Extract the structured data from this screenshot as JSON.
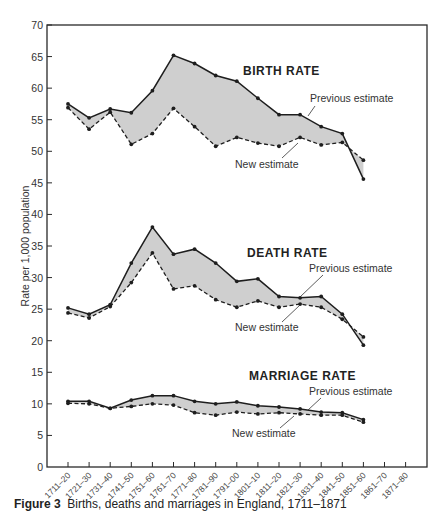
{
  "chart_data": {
    "type": "line",
    "title": "",
    "xlabel": "",
    "ylabel": "Rate per 1,000 population",
    "ylim": [
      0,
      70
    ],
    "yticks": [
      0,
      5,
      10,
      15,
      20,
      25,
      30,
      35,
      40,
      45,
      50,
      55,
      60,
      65,
      70
    ],
    "grid": false,
    "categories": [
      "1711–20",
      "1721–30",
      "1731–40",
      "1741–50",
      "1751–60",
      "1761–70",
      "1771–80",
      "1781–90",
      "1791–00",
      "1801–10",
      "1811–20",
      "1821–30",
      "1831–40",
      "1841–50",
      "1851–60",
      "1861–70",
      "1871–80"
    ],
    "groups": [
      {
        "name": "BIRTH RATE",
        "series": [
          {
            "name": "Previous estimate",
            "style": "solid",
            "values": [
              57.5,
              55.3,
              56.7,
              56.1,
              59.6,
              65.2,
              63.9,
              62.0,
              61.1,
              58.4,
              55.8,
              55.8,
              53.9,
              52.8,
              45.6,
              null,
              null
            ]
          },
          {
            "name": "New estimate",
            "style": "dashed",
            "values": [
              56.9,
              53.5,
              56.2,
              51.1,
              52.8,
              56.8,
              53.9,
              50.8,
              52.2,
              51.3,
              50.8,
              52.2,
              51.0,
              51.4,
              48.6,
              null,
              null
            ]
          }
        ]
      },
      {
        "name": "DEATH RATE",
        "series": [
          {
            "name": "Previous estimate",
            "style": "solid",
            "values": [
              25.2,
              24.2,
              25.7,
              32.3,
              38.0,
              33.7,
              34.5,
              32.3,
              29.4,
              29.8,
              27.0,
              26.8,
              27.0,
              24.2,
              19.3,
              null,
              null
            ]
          },
          {
            "name": "New estimate",
            "style": "dashed",
            "values": [
              24.4,
              23.6,
              25.4,
              29.2,
              33.9,
              28.2,
              28.7,
              26.5,
              25.3,
              26.3,
              25.3,
              25.8,
              25.3,
              23.4,
              20.6,
              null,
              null
            ]
          }
        ]
      },
      {
        "name": "MARRIAGE RATE",
        "series": [
          {
            "name": "Previous estimate",
            "style": "solid",
            "values": [
              10.4,
              10.4,
              9.3,
              10.6,
              11.3,
              11.3,
              10.4,
              10.0,
              10.3,
              9.7,
              9.5,
              9.2,
              8.7,
              8.6,
              7.5,
              null,
              null
            ]
          },
          {
            "name": "New estimate",
            "style": "dashed",
            "values": [
              10.1,
              10.0,
              9.3,
              9.6,
              10.0,
              9.8,
              8.6,
              8.2,
              8.7,
              8.4,
              8.6,
              8.4,
              8.2,
              8.2,
              7.1,
              null,
              null
            ]
          }
        ]
      }
    ],
    "annotations": [
      {
        "text": "BIRTH RATE",
        "group": 0
      },
      {
        "text": "Previous estimate",
        "group": 0
      },
      {
        "text": "New estimate",
        "group": 0
      },
      {
        "text": "DEATH RATE",
        "group": 1
      },
      {
        "text": "Previous estimate",
        "group": 1
      },
      {
        "text": "New estimate",
        "group": 1
      },
      {
        "text": "MARRIAGE RATE",
        "group": 2
      },
      {
        "text": "Previous estimate",
        "group": 2
      },
      {
        "text": "New estimate",
        "group": 2
      }
    ],
    "legend_position": "inline annotations",
    "shading": "area between previous and new estimate shaded grey"
  },
  "labels": {
    "birth_title": "BIRTH RATE",
    "death_title": "DEATH RATE",
    "marriage_title": "MARRIAGE RATE",
    "previous": "Previous estimate",
    "new": "New estimate"
  },
  "caption": {
    "figure": "Figure 3",
    "text": "Births, deaths and marriages in England, 1711–1871"
  },
  "colors": {
    "line": "#1e1e1e",
    "fill": "#cfcfcf",
    "axis": "#2a2a2a"
  }
}
